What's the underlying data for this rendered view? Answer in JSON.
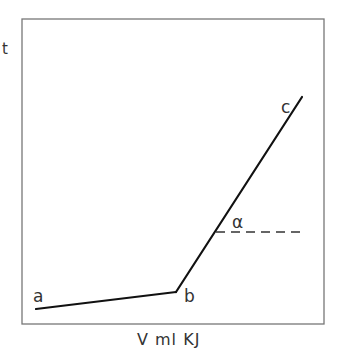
{
  "diagram": {
    "y_axis_label": "t",
    "x_axis_label": "V ml KJ",
    "points": {
      "a": {
        "label": "a"
      },
      "b": {
        "label": "b"
      },
      "c": {
        "label": "c"
      }
    },
    "angle_label": "α",
    "colors": {
      "line": "#111111",
      "frame": "#777777",
      "text": "#333333"
    }
  }
}
